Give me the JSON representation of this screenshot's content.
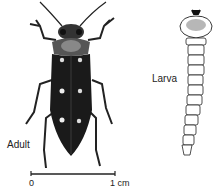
{
  "labels": {
    "adult": "Adult",
    "larva": "Larva"
  },
  "scale_bar": {
    "start_label": "0",
    "end_label": "1 cm"
  }
}
